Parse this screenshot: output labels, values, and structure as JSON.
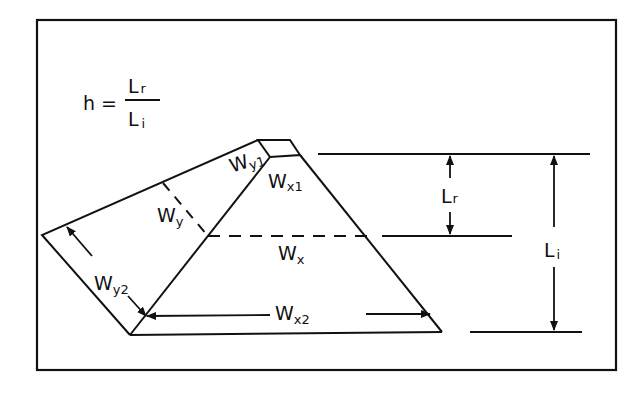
{
  "formula": {
    "lhs": "h =",
    "numerator": {
      "base": "L",
      "sub": "r"
    },
    "denominator": {
      "base": "L",
      "sub": "i"
    }
  },
  "labels": {
    "wy1": {
      "base": "W",
      "sub": "y1"
    },
    "wx1": {
      "base": "W",
      "sub": "x1"
    },
    "wy": {
      "base": "W",
      "sub": "y"
    },
    "wx": {
      "base": "W",
      "sub": "x"
    },
    "wy2": {
      "base": "W",
      "sub": "y2"
    },
    "wx2": {
      "base": "W",
      "sub": "x2"
    },
    "lr": {
      "base": "L",
      "sub": "r"
    },
    "li": {
      "base": "L",
      "sub": "i"
    }
  },
  "colors": {
    "ink": "#111111",
    "background": "#ffffff"
  }
}
